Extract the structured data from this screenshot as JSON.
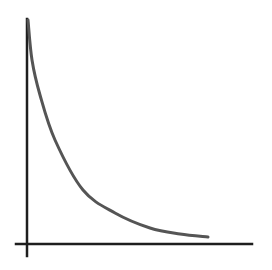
{
  "diagram": {
    "type": "decay-curve",
    "colors": {
      "background": "#ffffff",
      "axis": "#1e1e1e",
      "curve": "#555555"
    },
    "axes": {
      "origin": [
        27,
        244
      ],
      "y_axis": {
        "x": 27,
        "y_top": 19,
        "y_bottom": 256
      },
      "x_axis": {
        "y": 244,
        "x_left": 16,
        "x_right": 252
      }
    },
    "curve": {
      "points": [
        [
          28,
          20
        ],
        [
          32,
          60
        ],
        [
          40,
          95
        ],
        [
          55,
          140
        ],
        [
          83,
          190
        ],
        [
          115,
          213
        ],
        [
          150,
          228
        ],
        [
          180,
          234
        ],
        [
          208,
          237
        ]
      ]
    }
  }
}
